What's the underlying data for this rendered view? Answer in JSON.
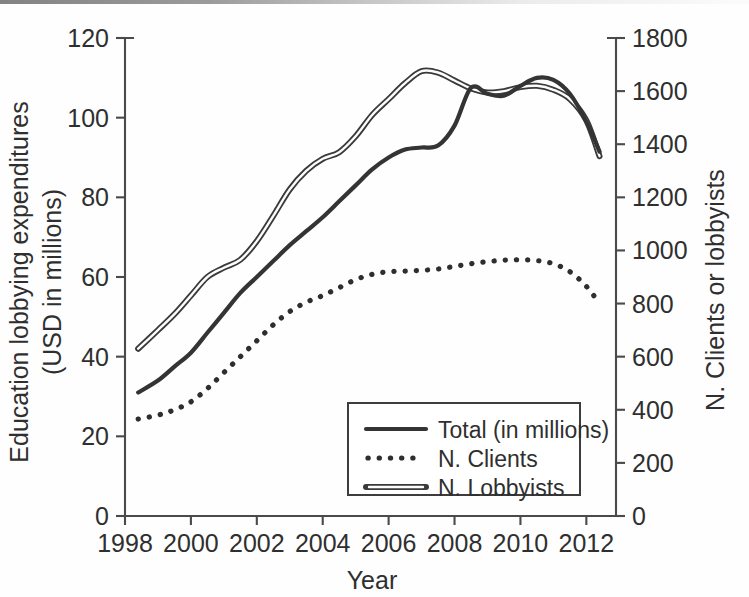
{
  "chart_data": {
    "type": "line",
    "title": "",
    "xlabel": "Year",
    "ylabel": "Education lobbying expenditures (USD in millions)",
    "ylabel_line1": "Education lobbying expenditures",
    "ylabel_line2": "(USD in millions)",
    "y2label": "N. Clients or lobbyists",
    "xlim": [
      1998,
      2012.9
    ],
    "ylim": [
      0,
      120
    ],
    "y2lim": [
      0,
      1800
    ],
    "grid": false,
    "legend_position": "lower-center",
    "x_ticks": [
      1998,
      2000,
      2002,
      2004,
      2006,
      2008,
      2010,
      2012
    ],
    "x_tick_labels": [
      "1998",
      "2000",
      "2002",
      "2004",
      "2006",
      "2008",
      "2010",
      "2012"
    ],
    "y_ticks": [
      0,
      20,
      40,
      60,
      80,
      100,
      120
    ],
    "y_tick_labels": [
      "0",
      "20",
      "40",
      "60",
      "80",
      "100",
      "120"
    ],
    "y2_ticks": [
      0,
      200,
      400,
      600,
      800,
      1000,
      1200,
      1400,
      1600,
      1800
    ],
    "y2_tick_labels": [
      "0",
      "200",
      "400",
      "600",
      "800",
      "1000",
      "1200",
      "1400",
      "1600",
      "1800"
    ],
    "x": [
      1998.4,
      1999,
      1999.5,
      2000,
      2000.5,
      2001,
      2001.5,
      2002,
      2002.5,
      2003,
      2003.5,
      2004,
      2004.5,
      2005,
      2005.5,
      2006,
      2006.5,
      2007,
      2007.5,
      2008,
      2008.5,
      2009,
      2009.5,
      2010,
      2010.5,
      2011,
      2011.5,
      2012,
      2012.4
    ],
    "series": [
      {
        "name": "Total (in millions)",
        "axis": "left",
        "units": "USD millions",
        "style": "solid",
        "values": [
          31.0,
          34.0,
          37.5,
          41.0,
          46.0,
          51.0,
          56.0,
          60.0,
          64.0,
          68.0,
          71.5,
          75.0,
          79.0,
          83.0,
          87.0,
          90.0,
          92.0,
          92.5,
          93.0,
          98.0,
          107.5,
          106.0,
          105.5,
          108.0,
          110.0,
          109.5,
          106.0,
          99.0,
          91.5
        ]
      },
      {
        "name": "N. Clients",
        "axis": "right",
        "units": "clients",
        "style": "dotted",
        "values": [
          365,
          380,
          400,
          430,
          480,
          540,
          600,
          660,
          720,
          770,
          805,
          830,
          860,
          890,
          910,
          920,
          922,
          925,
          930,
          940,
          950,
          958,
          963,
          965,
          962,
          950,
          920,
          865,
          800
        ]
      },
      {
        "name": "N. Lobbyists",
        "axis": "right",
        "units": "lobbyists",
        "style": "double-line",
        "values": [
          630,
          700,
          760,
          830,
          900,
          935,
          965,
          1035,
          1130,
          1230,
          1300,
          1345,
          1370,
          1430,
          1510,
          1570,
          1630,
          1675,
          1670,
          1640,
          1610,
          1595,
          1600,
          1615,
          1620,
          1605,
          1570,
          1490,
          1355
        ]
      }
    ],
    "legend": [
      {
        "label": "Total (in millions)",
        "style": "solid"
      },
      {
        "label": "N. Clients",
        "style": "dotted"
      },
      {
        "label": "N. Lobbyists",
        "style": "double-line"
      }
    ],
    "colors": {
      "total": "#343434",
      "clients": "#2e2e2e",
      "lobbyists": "#3a3a3a",
      "axis": "#4a4a4a",
      "background": "#fefefe"
    }
  }
}
